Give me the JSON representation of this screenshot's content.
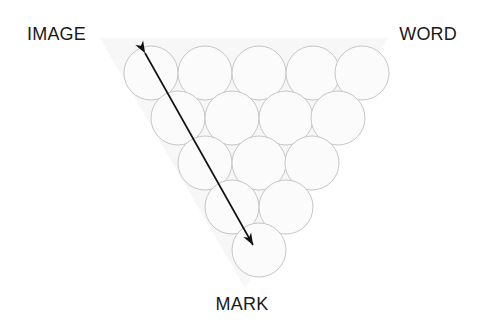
{
  "figure": {
    "background_color": "#ffffff",
    "labels": {
      "top_left": "IMAGE",
      "top_right": "WORD",
      "bottom": "MARK"
    },
    "triangle": {
      "orientation": "inverted",
      "fill_color": "#f7f7f7",
      "stroke_color": "none",
      "points": "100,38 388,38 245,288"
    },
    "circles": {
      "fill_color": "#fbfbfb",
      "stroke_color": "#c6c6c6",
      "stroke_width": 1,
      "radius": 27,
      "count": 15,
      "rows": [
        {
          "row": 1,
          "cy": 73,
          "cx": [
            151,
            205,
            259,
            313,
            362
          ]
        },
        {
          "row": 2,
          "cy": 118,
          "cx": [
            178,
            232,
            286,
            338
          ]
        },
        {
          "row": 3,
          "cy": 163,
          "cx": [
            205,
            259,
            312
          ]
        },
        {
          "row": 4,
          "cy": 207,
          "cx": [
            232,
            286
          ]
        },
        {
          "row": 5,
          "cy": 250,
          "cx": [
            259
          ]
        }
      ]
    },
    "arrow": {
      "color": "#111111",
      "stroke_width": 1.6,
      "double_headed": true,
      "start": {
        "x": 145,
        "y": 53
      },
      "end": {
        "x": 253,
        "y": 245
      }
    }
  }
}
